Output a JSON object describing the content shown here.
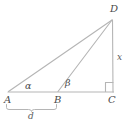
{
  "figure": {
    "type": "geometry-diagram",
    "width": 135,
    "height": 125,
    "background_color": "#ffffff",
    "stroke_color": "#b0b0b0",
    "label_color": "#4a4a4a"
  },
  "vertices": {
    "A": {
      "label": "A",
      "x": 8,
      "y": 92
    },
    "B": {
      "label": "B",
      "x": 58,
      "y": 92
    },
    "C": {
      "label": "C",
      "x": 113,
      "y": 92
    },
    "D": {
      "label": "D",
      "x": 112,
      "y": 20
    }
  },
  "segments": [
    {
      "name": "AD",
      "from": "A",
      "to": "D"
    },
    {
      "name": "BD",
      "from": "B",
      "to": "D"
    },
    {
      "name": "AC",
      "from": "A",
      "to": "C"
    },
    {
      "name": "DC",
      "from": "D",
      "to": "C"
    }
  ],
  "angles": [
    {
      "name": "alpha-at-A",
      "label": "α",
      "vertex": "A"
    },
    {
      "name": "beta-at-B",
      "label": "β",
      "vertex": "B"
    },
    {
      "name": "right-angle-at-C",
      "label": "",
      "vertex": "C",
      "marker": "square"
    }
  ],
  "measures": {
    "height": {
      "label": "x",
      "segment": "DC"
    },
    "base": {
      "label": "d",
      "segment": "AB"
    }
  },
  "brace": {
    "name": "brace-AB",
    "from_x": 6,
    "to_x": 57,
    "y": 107,
    "label": "d"
  }
}
